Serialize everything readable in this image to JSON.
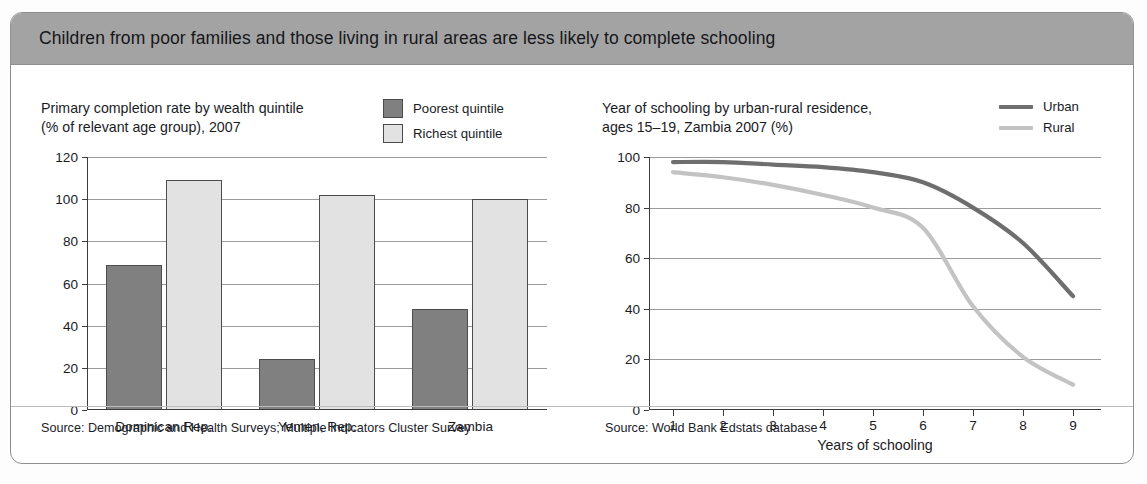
{
  "figure": {
    "title": "Children from poor families and those living in rural areas are less likely to complete schooling",
    "header_color": "#a3a3a3",
    "border_color": "#8e8e8e"
  },
  "sources": {
    "left": "Source: Demographic and Health Surveys; Multiple Indicators Cluster Survey",
    "right": "Source: World Bank Edstats database"
  },
  "colors": {
    "dark_series": "#808080",
    "light_series": "#e2e2e2",
    "urban_line": "#6e6e6e",
    "rural_line": "#c3c3c3",
    "gridline": "#9b9b9b",
    "axis": "#3c3c3c"
  },
  "chart_data": [
    {
      "type": "bar",
      "title": "Primary completion rate by wealth quintile (% of relevant age group), 2007",
      "title_line1": "Primary completion rate by wealth quintile",
      "title_line2": "(% of relevant age group), 2007",
      "xlabel": "",
      "ylabel": "",
      "ylim": [
        0,
        120
      ],
      "yticks": [
        0,
        20,
        40,
        60,
        80,
        100,
        120
      ],
      "ytick_labels": [
        "0",
        "20",
        "40",
        "60",
        "80",
        "100",
        "120"
      ],
      "grid": true,
      "legend_position": "top-right",
      "categories": [
        "Dominican Rep.",
        "Yemen, Rep.",
        "Zambia"
      ],
      "series": [
        {
          "name": "Poorest quintile",
          "color": "#808080",
          "values": [
            69,
            24,
            48
          ]
        },
        {
          "name": "Richest quintile",
          "color": "#e2e2e2",
          "values": [
            109,
            102,
            100
          ]
        }
      ]
    },
    {
      "type": "line",
      "title": "Year of schooling by urban-rural residence, ages 15–19, Zambia 2007 (%)",
      "title_line1": "Year of schooling by urban-rural residence,",
      "title_line2": "ages 15–19, Zambia 2007 (%)",
      "xlabel": "Years of schooling",
      "ylabel": "",
      "ylim": [
        0,
        100
      ],
      "yticks": [
        0,
        20,
        40,
        60,
        80,
        100
      ],
      "ytick_labels": [
        "0",
        "20",
        "40",
        "60",
        "80",
        "100"
      ],
      "xlim": [
        1,
        9
      ],
      "x": [
        1,
        2,
        3,
        4,
        5,
        6,
        7,
        8,
        9
      ],
      "xtick_labels": [
        "1",
        "2",
        "3",
        "4",
        "5",
        "6",
        "7",
        "8",
        "9"
      ],
      "grid": true,
      "legend_position": "top-right",
      "series": [
        {
          "name": "Urban",
          "color": "#6e6e6e",
          "values": [
            98,
            98,
            97,
            96,
            94,
            90,
            80,
            66,
            45
          ]
        },
        {
          "name": "Rural",
          "color": "#c3c3c3",
          "values": [
            94,
            92,
            89,
            85,
            80,
            72,
            41,
            21,
            10
          ]
        }
      ]
    }
  ]
}
